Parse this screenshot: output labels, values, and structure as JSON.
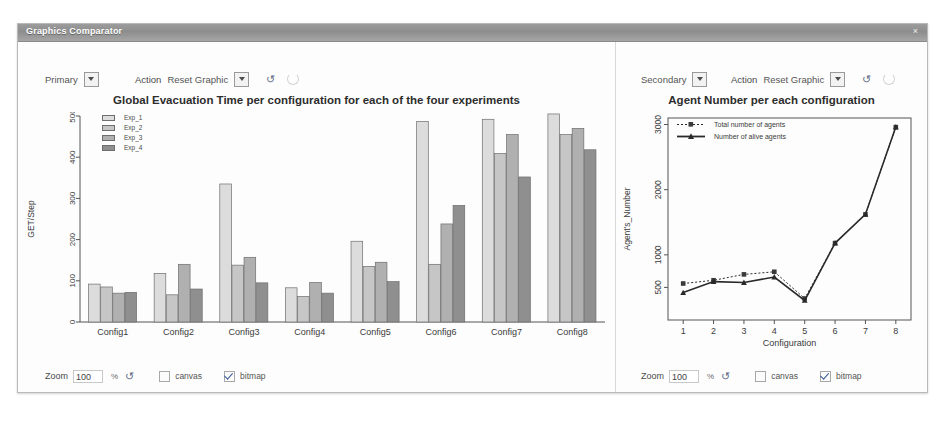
{
  "window": {
    "title": "Graphics Comparator",
    "close_icon": "close-icon",
    "close_glyph": "×"
  },
  "left_panel": {
    "source_select": {
      "value": "Primary"
    },
    "action_label": "Action",
    "action_select": {
      "value": "Reset Graphic"
    },
    "refresh_icon": "refresh-icon",
    "refresh_glyph": "↺",
    "busy_icon": "spinner-icon",
    "bottom": {
      "zoom_label": "Zoom",
      "zoom_value": "100",
      "percent_label": "%",
      "refresh_glyph": "↺",
      "canvas_label": "canvas",
      "canvas_checked": false,
      "bitmap_label": "bitmap",
      "bitmap_checked": true
    }
  },
  "right_panel": {
    "source_select": {
      "value": "Secondary"
    },
    "action_label": "Action",
    "action_select": {
      "value": "Reset Graphic"
    },
    "refresh_icon": "refresh-icon",
    "refresh_glyph": "↺",
    "busy_icon": "spinner-icon",
    "bottom": {
      "zoom_label": "Zoom",
      "zoom_value": "100",
      "percent_label": "%",
      "refresh_glyph": "↺",
      "canvas_label": "canvas",
      "canvas_checked": false,
      "bitmap_label": "bitmap",
      "bitmap_checked": true
    }
  },
  "chart_data": [
    {
      "type": "bar",
      "title": "Global Evacuation Time per configuration for each of the four experiments",
      "xlabel": "",
      "ylabel": "GET/Step",
      "categories": [
        "Config1",
        "Config2",
        "Config3",
        "Config4",
        "Config5",
        "Config6",
        "Config7",
        "Config8"
      ],
      "yticks": [
        0,
        100,
        200,
        300,
        400,
        500
      ],
      "ylim": [
        0,
        500
      ],
      "grid": false,
      "legend_position": "top-left",
      "series": [
        {
          "name": "Exp_1",
          "color": "#dcdcdc",
          "values": [
            92,
            118,
            335,
            83,
            196,
            487,
            492,
            505
          ]
        },
        {
          "name": "Exp_2",
          "color": "#c6c6c6",
          "values": [
            85,
            66,
            138,
            62,
            135,
            140,
            409,
            455
          ]
        },
        {
          "name": "Exp_3",
          "color": "#b0b0b0",
          "values": [
            70,
            140,
            157,
            96,
            145,
            238,
            455,
            470
          ]
        },
        {
          "name": "Exp_4",
          "color": "#8f8f8f",
          "values": [
            72,
            80,
            95,
            70,
            98,
            283,
            352,
            418
          ]
        }
      ]
    },
    {
      "type": "line",
      "title": "Agent Number per each configuration",
      "xlabel": "Configuration",
      "ylabel": "Agent's_Number",
      "x": [
        1,
        2,
        3,
        4,
        5,
        6,
        7,
        8
      ],
      "xticks": [
        1,
        2,
        3,
        4,
        5,
        6,
        7,
        8
      ],
      "yticks": [
        500,
        1000,
        2000,
        3000
      ],
      "ylim": [
        0,
        3100
      ],
      "grid": false,
      "legend_position": "top-left",
      "series": [
        {
          "name": "Total number of agents",
          "style": "dotted",
          "marker": "square",
          "values": [
            560,
            610,
            700,
            740,
            330,
            1180,
            1620,
            2960
          ]
        },
        {
          "name": "Number of alive agents",
          "style": "solid",
          "marker": "triangle",
          "values": [
            420,
            590,
            575,
            660,
            300,
            1180,
            1620,
            2960
          ]
        }
      ]
    }
  ]
}
